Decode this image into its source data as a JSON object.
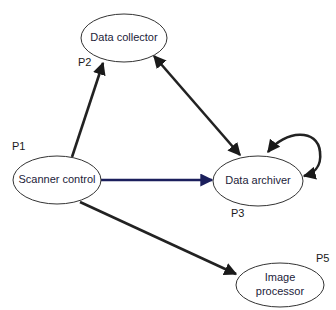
{
  "diagram": {
    "type": "process-communication-graph",
    "nodes": [
      {
        "id": "scanner",
        "label": "Scanner control",
        "process_id": "P1",
        "label_lines": [
          "Scanner control"
        ]
      },
      {
        "id": "collector",
        "label": "Data collector",
        "process_id": "P2",
        "label_lines": [
          "Data collector"
        ]
      },
      {
        "id": "archiver",
        "label": "Data archiver",
        "process_id": "P3",
        "label_lines": [
          "Data archiver"
        ]
      },
      {
        "id": "imageproc",
        "label": "Image processor",
        "process_id": "P5",
        "label_lines": [
          "Image",
          "processor"
        ]
      }
    ],
    "edges": [
      {
        "from": "scanner",
        "to": "collector",
        "direction": "forward"
      },
      {
        "from": "collector",
        "to": "archiver",
        "direction": "bidirectional"
      },
      {
        "from": "scanner",
        "to": "archiver",
        "direction": "forward"
      },
      {
        "from": "archiver",
        "to": "archiver",
        "direction": "self-loop-bidirectional"
      },
      {
        "from": "scanner",
        "to": "imageproc",
        "direction": "forward"
      }
    ],
    "colors": {
      "edge_default": "#222222",
      "edge_scanner_to_archiver": "#1b1f5c",
      "arrowhead": "#1a1a1a",
      "node_stroke": "#333333"
    }
  }
}
